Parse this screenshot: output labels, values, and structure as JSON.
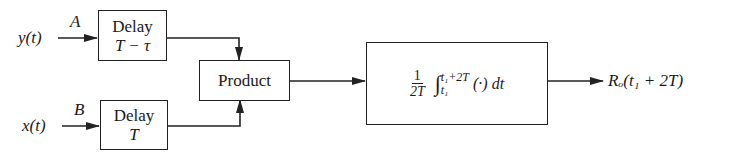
{
  "diagram": {
    "type": "block-diagram",
    "inputs": [
      {
        "id": "y",
        "label": "y(t)",
        "node": "A"
      },
      {
        "id": "x",
        "label": "x(t)",
        "node": "B"
      }
    ],
    "blocks": {
      "delay1": {
        "title": "Delay",
        "param": "T − τ"
      },
      "delay2": {
        "title": "Delay",
        "param": "T"
      },
      "product": {
        "title": "Product"
      },
      "integrator": {
        "frac_num": "1",
        "frac_den": "2T",
        "integral": "∫",
        "upper": "t₁+2T",
        "lower": "t₁",
        "integrand": "(·) dt"
      }
    },
    "output": {
      "label": "Rₒ(t₁ + 2T)"
    },
    "edges": [
      {
        "from": "y(t)",
        "to": "delay1"
      },
      {
        "from": "x(t)",
        "to": "delay2"
      },
      {
        "from": "delay1",
        "to": "product"
      },
      {
        "from": "delay2",
        "to": "product"
      },
      {
        "from": "product",
        "to": "integrator"
      },
      {
        "from": "integrator",
        "to": "output"
      }
    ]
  }
}
